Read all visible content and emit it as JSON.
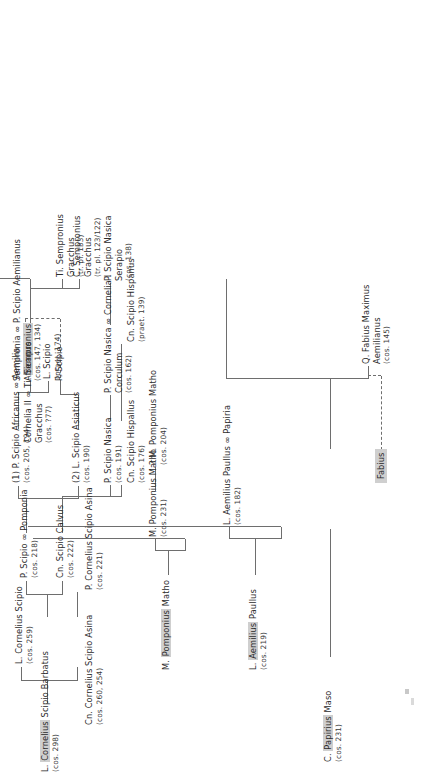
{
  "figure": {
    "type": "genealogical-stemma",
    "orientation": "printed sideways (rotated 90 degrees counter-clockwise)",
    "line_color": "#6e6e6e",
    "highlight_color": "#cfcfcf",
    "text_color": "#2b2b2b"
  },
  "box_labels": [
    {
      "id": "fabius_box",
      "text": "Fabius"
    }
  ],
  "nodes": [
    {
      "id": "papirius_maso",
      "name": "C. Papirius Maso",
      "highlight": "Papirius",
      "year": "(cos. 231)"
    },
    {
      "id": "papiria",
      "name": "L. Aemilius Paullus ∞ Papiria",
      "highlight": "",
      "year": "(cos. 182)"
    },
    {
      "id": "fabius_maximus",
      "name": "Q. Fabius Maximus",
      "highlight": "",
      "name2": "Aemilianus",
      "year": "(cos. 145)"
    },
    {
      "id": "aemilius_paullus",
      "name": "L. Aemilius Paullus",
      "highlight": "Aemilius",
      "year": "(cos. 219)"
    },
    {
      "id": "aemilia",
      "name": "(1) P. Scipio Africanus ∞ Aemilia",
      "highlight": "",
      "year": "(cos. 205, 194)"
    },
    {
      "id": "ti_gracchus_cos",
      "name": "Cornelia II ∞ Ti. Sempronius",
      "highlight": "Sempronius",
      "name2": "Gracchus",
      "year": "(cos. ?77)"
    },
    {
      "id": "scipio_aemilianus",
      "name": "Sempronia ∞ P. Scipio Aemilianus",
      "highlight": "",
      "name2": "Africanus",
      "year": "(cos. 147, 134)"
    },
    {
      "id": "m_pomponius_matho_top",
      "name": "M. Pomponius Matho",
      "highlight": "Pomponius",
      "year": ""
    },
    {
      "id": "m_pomponius_matho_231",
      "name": "M. Pomponius Matho",
      "highlight": "",
      "year": "(cos. 231)"
    },
    {
      "id": "m_pomponius_matho_204",
      "name": "? M. Pomponius Matho",
      "highlight": "",
      "year": "(cos. 204)"
    },
    {
      "id": "l_scipio_praet",
      "name": "L. Scipio",
      "highlight": "",
      "year": "(praet. 174)"
    },
    {
      "id": "c_sempronius_gracchus",
      "name": "C. Sempronius",
      "highlight": "",
      "name2": "Gracchus",
      "year": "(tr. pl. 123/122)"
    },
    {
      "id": "barbatus",
      "name": "L. Cornelius Scipio Barbatus",
      "highlight": "Cornelius",
      "year": "(cos. 298)"
    },
    {
      "id": "l_cornelius_scipio",
      "name": "L. Cornelius Scipio",
      "highlight": "",
      "year": "(cos. 259)"
    },
    {
      "id": "p_scipio_pomponia",
      "name": "P. Scipio ∞ Pomponia",
      "highlight": "",
      "year": "(cos. 218)"
    },
    {
      "id": "cn_scipio_calvus",
      "name": "Cn. Scipio Calvus",
      "highlight": "",
      "year": "(cos. 222)"
    },
    {
      "id": "cn_scipio_asina",
      "name": "Cn. Cornelius Scipio Asina",
      "highlight": "",
      "year": "(cos. 260, 254)"
    },
    {
      "id": "p_scipio_asina",
      "name": "P. Cornelius Scipio Asina",
      "highlight": "",
      "year": "(cos. 221)"
    },
    {
      "id": "l_scipio_asiaticus",
      "name": "(2) L. Scipio Asiaticus",
      "highlight": "",
      "year": "(cos. 190)"
    },
    {
      "id": "p_scipio_dashed",
      "name": "P. Scipio",
      "highlight": "",
      "year": ""
    },
    {
      "id": "ti_gracchus_133",
      "name": "Ti. Sempronius",
      "highlight": "",
      "name2": "Gracchus",
      "year": "(tr. pl. 133)"
    },
    {
      "id": "p_scipio_nasica_191",
      "name": "P. Scipio Nasica",
      "highlight": "",
      "year": "(cos. 191)"
    },
    {
      "id": "nasica_corculum",
      "name": "P. Scipio Nasica ∞ Cornelia I",
      "highlight": "",
      "name2": "Corculum",
      "year": "(cos. 162)"
    },
    {
      "id": "nasica_serapio",
      "name": "P. Scipio Nasica",
      "highlight": "",
      "name2": "Serapio",
      "year": "(cos. 138)"
    },
    {
      "id": "cn_scipio_hispallus",
      "name": "Cn. Scipio Hispallus",
      "highlight": "",
      "year": "(cos. 176)"
    },
    {
      "id": "cn_scipio_hispanus",
      "name": "Cn. Scipio Hispanus",
      "highlight": "",
      "year": "(praet. 139)"
    }
  ]
}
